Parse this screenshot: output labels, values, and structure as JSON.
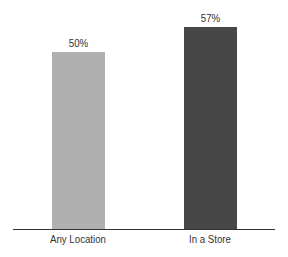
{
  "chart_data": {
    "type": "bar",
    "title": "",
    "xlabel": "",
    "ylabel": "",
    "categories": [
      "Any Location",
      "In a Store"
    ],
    "values": [
      50,
      57
    ],
    "value_labels": [
      "50%",
      "57%"
    ],
    "colors": [
      "#a9a9a9",
      "#3e3e3e"
    ],
    "ylim": [
      0,
      57
    ],
    "grid": false,
    "legend": null
  }
}
